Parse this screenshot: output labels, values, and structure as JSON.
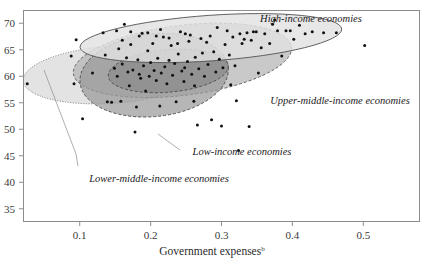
{
  "chart_data": {
    "type": "scatter",
    "title": "",
    "xlabel": "Government expenses",
    "xlabel_superscript": "b",
    "ylabel": "",
    "xlim": [
      0.02,
      0.58
    ],
    "ylim": [
      32.5,
      72.5
    ],
    "xticks": [
      "0.1",
      "0.2",
      "0.3",
      "0.4",
      "0.5"
    ],
    "xtick_values": [
      0.1,
      0.2,
      0.3,
      0.4,
      0.5
    ],
    "yticks": [
      "35",
      "40",
      "45",
      "50",
      "55",
      "60",
      "65",
      "70"
    ],
    "ytick_values": [
      35,
      40,
      45,
      50,
      55,
      60,
      65,
      70
    ],
    "grid": false,
    "legend_position": "inline-annotations",
    "annotations": [
      {
        "name": "high-income",
        "text": "High-income economies"
      },
      {
        "name": "upper-middle-income",
        "text": "Upper-middle-income economies"
      },
      {
        "name": "low-income",
        "text": "Low-income economies"
      },
      {
        "name": "lower-middle-income",
        "text": "Lower-middle-income economies"
      }
    ],
    "groups": [
      {
        "name": "High-income economies",
        "fill": "#e2e2e2",
        "stroke": "#555555",
        "stroke_style": "solid",
        "ellipse": {
          "cx": 0.285,
          "cy": 67.2,
          "rx": 0.185,
          "ry": 4.3,
          "rotation_deg": -4
        }
      },
      {
        "name": "Upper-middle-income economies",
        "fill": "#b4b4b4",
        "stroke": "#5a5a5a",
        "stroke_style": "dashed",
        "ellipse": {
          "cx": 0.245,
          "cy": 63.0,
          "rx": 0.155,
          "ry": 6.6,
          "rotation_deg": -7
        }
      },
      {
        "name": "Low-income economies",
        "fill": "#9a9a9a",
        "stroke": "#4a4a4a",
        "stroke_style": "dashed",
        "ellipse": {
          "cx": 0.205,
          "cy": 60.2,
          "rx": 0.105,
          "ry": 7.8,
          "rotation_deg": -6
        }
      },
      {
        "name": "Lower-middle-income economies",
        "fill": "#d8d8d8",
        "stroke": "#6e6e6e",
        "stroke_style": "dotted",
        "ellipse": {
          "cx": 0.145,
          "cy": 60.3,
          "rx": 0.125,
          "ry": 5.4,
          "rotation_deg": -4
        }
      },
      {
        "name": "Core-overlap",
        "fill": "#8a8a8a",
        "stroke": "#4a4a4a",
        "stroke_style": "dashed",
        "ellipse": {
          "cx": 0.225,
          "cy": 61.0,
          "rx": 0.085,
          "ry": 4.0,
          "rotation_deg": -5
        }
      }
    ],
    "points": [
      [
        0.026,
        58.6
      ],
      [
        0.088,
        63.8
      ],
      [
        0.092,
        58.6
      ],
      [
        0.095,
        66.9
      ],
      [
        0.104,
        52.0
      ],
      [
        0.118,
        60.6
      ],
      [
        0.133,
        68.2
      ],
      [
        0.136,
        64.0
      ],
      [
        0.139,
        55.2
      ],
      [
        0.145,
        55.1
      ],
      [
        0.149,
        61.5
      ],
      [
        0.152,
        68.6
      ],
      [
        0.153,
        60.0
      ],
      [
        0.155,
        65.2
      ],
      [
        0.158,
        55.3
      ],
      [
        0.16,
        62.3
      ],
      [
        0.163,
        69.8
      ],
      [
        0.166,
        63.5
      ],
      [
        0.168,
        60.8
      ],
      [
        0.17,
        58.2
      ],
      [
        0.172,
        66.0
      ],
      [
        0.175,
        61.2
      ],
      [
        0.178,
        49.5
      ],
      [
        0.18,
        54.2
      ],
      [
        0.182,
        63.1
      ],
      [
        0.184,
        60.4
      ],
      [
        0.186,
        59.6
      ],
      [
        0.188,
        68.1
      ],
      [
        0.19,
        62.0
      ],
      [
        0.193,
        57.2
      ],
      [
        0.196,
        64.8
      ],
      [
        0.198,
        60.0
      ],
      [
        0.2,
        62.6
      ],
      [
        0.203,
        66.2
      ],
      [
        0.205,
        61.1
      ],
      [
        0.208,
        59.2
      ],
      [
        0.21,
        63.4
      ],
      [
        0.213,
        54.4
      ],
      [
        0.215,
        60.6
      ],
      [
        0.218,
        67.4
      ],
      [
        0.22,
        61.8
      ],
      [
        0.223,
        58.6
      ],
      [
        0.226,
        63.0
      ],
      [
        0.229,
        65.8
      ],
      [
        0.231,
        60.2
      ],
      [
        0.234,
        62.4
      ],
      [
        0.236,
        55.2
      ],
      [
        0.239,
        64.2
      ],
      [
        0.242,
        68.4
      ],
      [
        0.244,
        61.0
      ],
      [
        0.247,
        59.0
      ],
      [
        0.249,
        68.0
      ],
      [
        0.252,
        62.8
      ],
      [
        0.254,
        66.6
      ],
      [
        0.256,
        67.8
      ],
      [
        0.258,
        60.4
      ],
      [
        0.261,
        55.3
      ],
      [
        0.263,
        63.6
      ],
      [
        0.266,
        50.8
      ],
      [
        0.268,
        61.4
      ],
      [
        0.271,
        67.1
      ],
      [
        0.273,
        64.4
      ],
      [
        0.276,
        60.0
      ],
      [
        0.279,
        66.4
      ],
      [
        0.281,
        62.2
      ],
      [
        0.284,
        67.6
      ],
      [
        0.286,
        51.8
      ],
      [
        0.289,
        64.6
      ],
      [
        0.292,
        60.8
      ],
      [
        0.294,
        69.2
      ],
      [
        0.297,
        63.2
      ],
      [
        0.3,
        50.6
      ],
      [
        0.302,
        61.6
      ],
      [
        0.305,
        66.0
      ],
      [
        0.308,
        68.6
      ],
      [
        0.311,
        64.0
      ],
      [
        0.313,
        58.4
      ],
      [
        0.316,
        67.4
      ],
      [
        0.319,
        62.0
      ],
      [
        0.321,
        55.4
      ],
      [
        0.324,
        46.0
      ],
      [
        0.326,
        68.0
      ],
      [
        0.329,
        66.2
      ],
      [
        0.332,
        67.0
      ],
      [
        0.336,
        68.2
      ],
      [
        0.339,
        50.5
      ],
      [
        0.342,
        66.8
      ],
      [
        0.345,
        68.4
      ],
      [
        0.349,
        68.4
      ],
      [
        0.352,
        60.6
      ],
      [
        0.356,
        65.4
      ],
      [
        0.361,
        68.0
      ],
      [
        0.368,
        66.2
      ],
      [
        0.372,
        69.8
      ],
      [
        0.375,
        70.6
      ],
      [
        0.379,
        68.6
      ],
      [
        0.385,
        63.8
      ],
      [
        0.391,
        68.6
      ],
      [
        0.397,
        68.6
      ],
      [
        0.402,
        67.0
      ],
      [
        0.41,
        69.6
      ],
      [
        0.418,
        68.0
      ],
      [
        0.428,
        68.4
      ],
      [
        0.444,
        68.2
      ],
      [
        0.462,
        68.2
      ],
      [
        0.502,
        65.8
      ],
      [
        0.208,
        67.6
      ],
      [
        0.226,
        67.2
      ],
      [
        0.238,
        66.2
      ],
      [
        0.248,
        61.6
      ],
      [
        0.262,
        58.2
      ],
      [
        0.214,
        68.8
      ],
      [
        0.196,
        68.2
      ],
      [
        0.184,
        67.6
      ],
      [
        0.172,
        68.4
      ],
      [
        0.16,
        66.8
      ]
    ]
  }
}
